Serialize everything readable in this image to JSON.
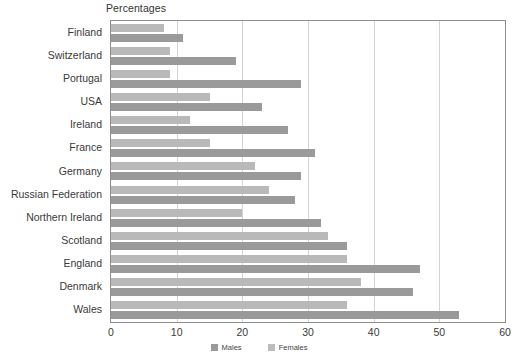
{
  "chart_data": {
    "type": "bar",
    "orientation": "horizontal",
    "title": "Percentages",
    "xlabel": "",
    "ylabel": "",
    "xlim": [
      0,
      60
    ],
    "xticks": [
      0,
      10,
      20,
      30,
      40,
      50,
      60
    ],
    "grid": true,
    "legend_position": "bottom",
    "categories": [
      "Finland",
      "Switzerland",
      "Portugal",
      "USA",
      "Ireland",
      "France",
      "Germany",
      "Russian Federation",
      "Northern Ireland",
      "Scotland",
      "England",
      "Denmark",
      "Wales"
    ],
    "series": [
      {
        "name": "Males",
        "color": "#b9b9b9",
        "values": [
          8,
          9,
          9,
          15,
          12,
          15,
          22,
          24,
          20,
          33,
          36,
          38,
          36
        ]
      },
      {
        "name": "Females",
        "color": "#9a9a9a",
        "values": [
          11,
          19,
          29,
          23,
          27,
          31,
          29,
          28,
          32,
          36,
          47,
          46,
          53
        ]
      }
    ]
  },
  "legend": {
    "items": [
      {
        "label": "Males",
        "color": "#9a9a9a"
      },
      {
        "label": "Females",
        "color": "#bdbdbd"
      }
    ]
  },
  "axis": {
    "tick_labels": [
      "0",
      "10",
      "20",
      "30",
      "40",
      "50",
      "60"
    ]
  }
}
